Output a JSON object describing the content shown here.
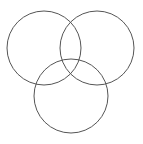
{
  "diagram": {
    "type": "venn",
    "background": "#ffffff",
    "stroke_color": "#555555",
    "stroke_width": 1,
    "circles": [
      {
        "name": "left",
        "cx": 44,
        "cy": 48,
        "r": 37
      },
      {
        "name": "right",
        "cx": 97,
        "cy": 48,
        "r": 37
      },
      {
        "name": "bottom",
        "cx": 71,
        "cy": 96,
        "r": 37
      }
    ]
  }
}
